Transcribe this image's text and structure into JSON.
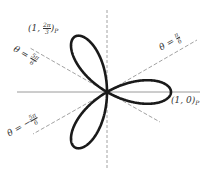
{
  "chart_data": {
    "type": "line",
    "subtype": "polar",
    "title": "",
    "equation": "r = cos(3θ)",
    "petals": 3,
    "petal_tips": [
      {
        "label": "(1, 0)_P",
        "r": 1,
        "theta": "0"
      },
      {
        "label": "(1, 2π/3)_P",
        "r": 1,
        "theta": "2π/3"
      },
      {
        "r": 1,
        "theta": "-2π/3"
      }
    ],
    "reference_lines": [
      {
        "label": "θ = π/6",
        "theta": "π/6",
        "style": "dashed"
      },
      {
        "label": "θ = 5π/6",
        "theta": "5π/6",
        "style": "dashed"
      },
      {
        "label": "θ = -5π/6",
        "theta": "-5π/6",
        "style": "dashed"
      }
    ],
    "axes": {
      "horizontal": "solid",
      "vertical": "dashed"
    },
    "grid": false,
    "legend": null
  },
  "labels": {
    "top_point": {
      "prefix": "(1, ",
      "num": "2π",
      "den": "3",
      "suffix": ")",
      "sub": "P"
    },
    "right_point": {
      "text": "(1, 0)",
      "sub": "P"
    },
    "line_pi6": {
      "prefix": "θ = ",
      "num": "π",
      "den": "6"
    },
    "line_5pi6": {
      "prefix": "θ = ",
      "num": "5π",
      "den": "6"
    },
    "line_neg5pi6": {
      "prefix": "θ = −",
      "num": "5π",
      "den": "6"
    }
  },
  "colors": {
    "curve": "#1a1a1a",
    "axis": "#9a9a9a",
    "dashed": "#8a8a8a",
    "text": "#333333"
  }
}
